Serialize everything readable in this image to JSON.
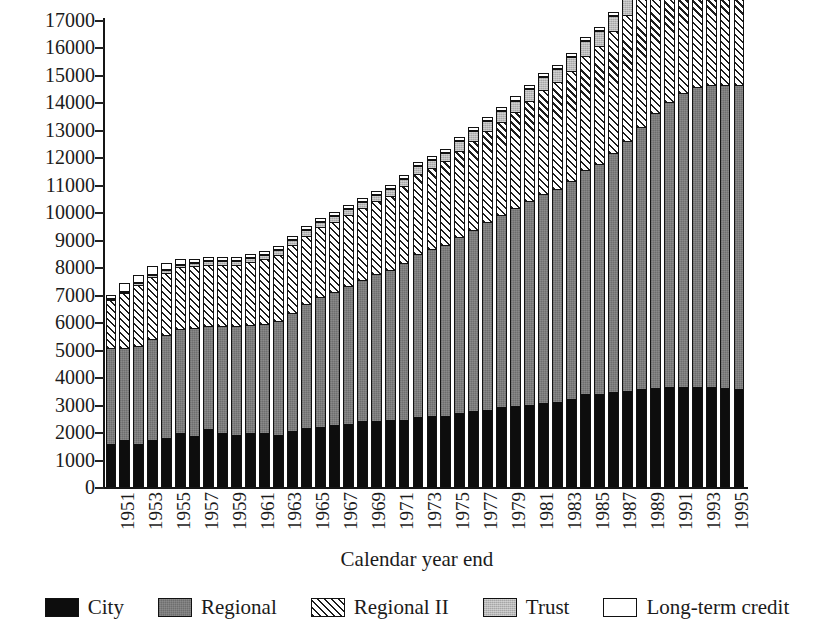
{
  "chart_data": {
    "type": "bar",
    "subtype": "stacked-bar",
    "title": "",
    "xlabel": "Calendar year end",
    "ylabel": "",
    "ylim": [
      0,
      17000
    ],
    "ytick_step": 1000,
    "ytick_labels": [
      "0",
      "1000",
      "2000",
      "3000",
      "4000",
      "5000",
      "6000",
      "7000",
      "8000",
      "9000",
      "10000",
      "11000",
      "12000",
      "13000",
      "14000",
      "15000",
      "16000",
      "17000"
    ],
    "grid": false,
    "legend_position": "bottom",
    "xtick_labels": [
      "1951",
      "1953",
      "1955",
      "1957",
      "1959",
      "1961",
      "1963",
      "1965",
      "1967",
      "1969",
      "1971",
      "1973",
      "1975",
      "1977",
      "1979",
      "1981",
      "1983",
      "1985",
      "1987",
      "1989",
      "1991",
      "1993",
      "1995"
    ],
    "categories": [
      "1951",
      "1952",
      "1953",
      "1954",
      "1955",
      "1956",
      "1957",
      "1958",
      "1959",
      "1960",
      "1961",
      "1962",
      "1963",
      "1964",
      "1965",
      "1966",
      "1967",
      "1968",
      "1969",
      "1970",
      "1971",
      "1972",
      "1973",
      "1974",
      "1975",
      "1976",
      "1977",
      "1978",
      "1979",
      "1980",
      "1981",
      "1982",
      "1983",
      "1984",
      "1985",
      "1986",
      "1987",
      "1988",
      "1989",
      "1990",
      "1991",
      "1992",
      "1993",
      "1994",
      "1995",
      "1996"
    ],
    "series": [
      {
        "name": "City",
        "color": "#0d0d0d",
        "pattern": "solid",
        "values": [
          1550,
          1700,
          1550,
          1700,
          1800,
          1950,
          1850,
          2100,
          1950,
          1900,
          1950,
          1950,
          1900,
          2050,
          2150,
          2200,
          2250,
          2300,
          2400,
          2400,
          2450,
          2450,
          2550,
          2600,
          2600,
          2700,
          2750,
          2800,
          2900,
          2950,
          3000,
          3050,
          3100,
          3200,
          3400,
          3400,
          3450,
          3500,
          3550,
          3600,
          3650,
          3650,
          3650,
          3650,
          3600,
          3550
        ]
      },
      {
        "name": "Regional",
        "color": "#7d7d7d",
        "pattern": "light-stipple",
        "values": [
          3500,
          3350,
          3600,
          3700,
          3750,
          3800,
          3950,
          3750,
          3900,
          3950,
          3950,
          4000,
          4150,
          4300,
          4500,
          4700,
          4850,
          5000,
          5150,
          5350,
          5450,
          5700,
          5950,
          6050,
          6200,
          6400,
          6600,
          6850,
          7000,
          7200,
          7400,
          7600,
          7750,
          7950,
          8150,
          8350,
          8700,
          9100,
          9550,
          10000,
          10350,
          10700,
          10900,
          11000,
          11050,
          11100
        ]
      },
      {
        "name": "Regional II",
        "color": "#ffffff",
        "pattern": "diagonal-hatch",
        "values": [
          1750,
          2000,
          2200,
          2250,
          2250,
          2250,
          2250,
          2250,
          2250,
          2250,
          2300,
          2350,
          2400,
          2450,
          2500,
          2550,
          2550,
          2600,
          2600,
          2650,
          2700,
          2800,
          2900,
          2950,
          3050,
          3150,
          3250,
          3300,
          3400,
          3500,
          3650,
          3800,
          3900,
          4000,
          4150,
          4300,
          4450,
          4600,
          4750,
          4900,
          4950,
          5000,
          5050,
          5100,
          5100,
          5100
        ]
      },
      {
        "name": "Trust",
        "color": "#b9b9b9",
        "pattern": "stipple",
        "values": [
          50,
          60,
          70,
          80,
          90,
          100,
          110,
          120,
          130,
          140,
          150,
          160,
          170,
          180,
          190,
          200,
          210,
          220,
          230,
          240,
          250,
          260,
          280,
          300,
          320,
          340,
          360,
          380,
          400,
          420,
          440,
          460,
          480,
          500,
          520,
          540,
          560,
          580,
          600,
          620,
          620,
          620,
          620,
          620,
          600,
          580
        ]
      },
      {
        "name": "Long-term credit",
        "color": "#ffffff",
        "pattern": "empty",
        "values": [
          150,
          300,
          300,
          300,
          250,
          200,
          150,
          150,
          150,
          150,
          150,
          150,
          150,
          150,
          150,
          150,
          150,
          150,
          150,
          150,
          150,
          150,
          150,
          150,
          150,
          150,
          150,
          150,
          150,
          150,
          150,
          150,
          150,
          150,
          150,
          150,
          150,
          150,
          150,
          150,
          150,
          150,
          150,
          150,
          150,
          150
        ]
      }
    ],
    "totals": [
      7000,
      7410,
      7720,
      8030,
      8140,
      8300,
      8310,
      8370,
      8380,
      8390,
      8500,
      8610,
      8770,
      9130,
      9490,
      9800,
      10010,
      10270,
      10530,
      10790,
      11000,
      11360,
      11830,
      12050,
      12320,
      12740,
      13110,
      13480,
      13850,
      14220,
      14640,
      15060,
      15380,
      15800,
      16370,
      16740,
      17310,
      17930,
      18600,
      19270,
      19720,
      20120,
      20370,
      20520,
      20500,
      20430
    ]
  },
  "legend": {
    "items": [
      {
        "label": "City",
        "swatch": "city"
      },
      {
        "label": "Regional",
        "swatch": "regional"
      },
      {
        "label": "Regional II",
        "swatch": "regional2"
      },
      {
        "label": "Trust",
        "swatch": "trust"
      },
      {
        "label": "Long-term credit",
        "swatch": "ltc"
      }
    ]
  }
}
